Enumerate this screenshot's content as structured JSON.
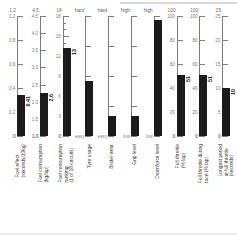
{
  "chart_data": {
    "type": "bar",
    "title": "",
    "subtitle": "",
    "xlabel": "",
    "ylabel": "",
    "grid": false,
    "legend": "none",
    "layout": "ten independent vertical gauge scales, one bar each",
    "categories": [
      "Fuel effect (seconds/10kg)",
      "Fuel consumption (kg/lap)",
      "Fuel consumption or revving (l of 18 circuits)",
      "Tyre usage",
      "Brake wear",
      "Grip level",
      "Downforce level",
      "Full throttle (% lap)",
      "Full throttle during race (% lap)",
      "Longest period at full throttle (seconds)"
    ],
    "values": [
      0.41,
      2.6,
      13,
      0,
      0,
      0,
      0,
      51,
      51,
      10
    ],
    "panels": [
      {
        "name": "fuel-effect",
        "caption": "Fuel effect\n(seconds/10kg)",
        "top_label": "1.2",
        "bottom_label": "0",
        "axis_kind": "numeric",
        "ticks": [
          "1.2",
          "0.8",
          "0.6",
          "0.4",
          "0.2",
          "0"
        ],
        "tick_positions": [
          0,
          24,
          48,
          72,
          96,
          120
        ],
        "value": "0.41",
        "value_shown": true,
        "bar_top_pct": 66,
        "ylim": [
          0,
          1.2
        ]
      },
      {
        "name": "fuel-consumption",
        "caption": "Fuel consumption\n(kg/lap)",
        "top_label": "4.5",
        "bottom_label": "1.0",
        "axis_kind": "numeric",
        "ticks": [
          "4.5",
          "4.0",
          "3.5",
          "3.0",
          "2.5",
          "2.0",
          "1.5",
          "1.0"
        ],
        "tick_positions": [
          0,
          17.1,
          34.3,
          51.4,
          68.6,
          85.7,
          102.9,
          120
        ],
        "value": "2.6",
        "value_shown": true,
        "bar_top_pct": 64,
        "ylim": [
          1.0,
          4.5
        ]
      },
      {
        "name": "fuel-consumption-revving",
        "caption": "Fuel consumption\nranking\n(1 of 18 circuits)",
        "top_label": "18",
        "bottom_label": "0",
        "axis_kind": "numeric",
        "ticks": [
          "18",
          "15",
          "12",
          "9",
          "6",
          "3",
          "0"
        ],
        "tick_positions": [
          0,
          20,
          40,
          60,
          80,
          100,
          120
        ],
        "value": "13",
        "value_shown": true,
        "bar_top_pct": 27,
        "ylim": [
          0,
          18
        ]
      },
      {
        "name": "tyre-usage",
        "caption": "Tyre usage",
        "top_label": "hard",
        "bottom_label": "easy",
        "axis_kind": "categorical",
        "ticks": [
          "",
          "",
          "",
          "",
          ""
        ],
        "tick_positions": [
          0,
          30,
          60,
          90,
          120
        ],
        "value": "",
        "value_shown": false,
        "bar_top_pct": 54,
        "ylim": [
          0,
          1
        ]
      },
      {
        "name": "brake-wear",
        "caption": "Brake wear",
        "top_label": "hard",
        "bottom_label": "easy",
        "axis_kind": "categorical",
        "ticks": [
          "",
          "",
          "",
          "",
          ""
        ],
        "tick_positions": [
          0,
          30,
          60,
          90,
          120
        ],
        "value": "",
        "value_shown": false,
        "bar_top_pct": 83,
        "ylim": [
          0,
          1
        ]
      },
      {
        "name": "grip-level",
        "caption": "Grip level",
        "top_label": "high",
        "bottom_label": "low",
        "axis_kind": "categorical",
        "ticks": [
          "",
          "",
          "",
          "",
          ""
        ],
        "tick_positions": [
          0,
          30,
          60,
          90,
          120
        ],
        "value": "",
        "value_shown": false,
        "bar_top_pct": 83,
        "ylim": [
          0,
          1
        ]
      },
      {
        "name": "downforce-level",
        "caption": "Downforce level",
        "top_label": "high",
        "bottom_label": "low",
        "axis_kind": "categorical",
        "ticks": [
          "",
          "",
          "",
          "",
          ""
        ],
        "tick_positions": [
          0,
          30,
          60,
          90,
          120
        ],
        "value": "",
        "value_shown": false,
        "bar_top_pct": 3,
        "ylim": [
          0,
          1
        ]
      },
      {
        "name": "full-throttle",
        "caption": "Full throttle\n(% lap)",
        "top_label": "100",
        "bottom_label": "0",
        "axis_kind": "numeric",
        "ticks": [
          "100",
          "80",
          "60",
          "40",
          "20",
          "0"
        ],
        "tick_positions": [
          0,
          24,
          48,
          72,
          96,
          120
        ],
        "value": "51",
        "value_shown": true,
        "bar_top_pct": 49,
        "ylim": [
          0,
          100
        ]
      },
      {
        "name": "full-throttle-race",
        "caption": "Full throttle during\nrace (% lap)",
        "top_label": "100",
        "bottom_label": "0",
        "axis_kind": "numeric",
        "ticks": [
          "100",
          "80",
          "60",
          "40",
          "20",
          "0"
        ],
        "tick_positions": [
          0,
          24,
          48,
          72,
          96,
          120
        ],
        "value": "51",
        "value_shown": true,
        "bar_top_pct": 49,
        "ylim": [
          0,
          100
        ]
      },
      {
        "name": "longest-full-throttle",
        "caption": "Longest period\nat full throttle\n(seconds)",
        "top_label": "25",
        "bottom_label": "0",
        "axis_kind": "numeric",
        "ticks": [
          "25",
          "20",
          "15",
          "10",
          "5",
          "0"
        ],
        "tick_positions": [
          0,
          24,
          48,
          72,
          96,
          120
        ],
        "value": "10",
        "value_shown": true,
        "bar_top_pct": 60,
        "ylim": [
          0,
          25
        ]
      }
    ],
    "colors": {
      "bar": "#1b1b1b",
      "axis": "#7b7b7b",
      "text": "#3d3d3d",
      "background": "#ffffff"
    }
  }
}
